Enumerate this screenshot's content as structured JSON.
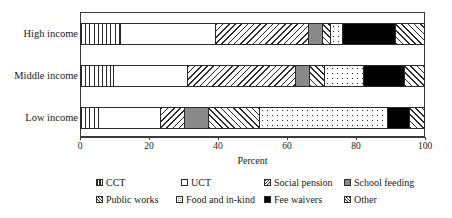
{
  "chart_data": {
    "type": "bar",
    "orientation": "horizontal",
    "stacked": true,
    "normalized_percent": true,
    "title": "",
    "xlabel": "Percent",
    "ylabel": "",
    "xlim": [
      0,
      100
    ],
    "xticks": [
      0,
      20,
      40,
      60,
      80,
      100
    ],
    "xtick_labels": [
      "0",
      "20",
      "40",
      "60",
      "80",
      "100"
    ],
    "grid": false,
    "legend_position": "bottom",
    "categories": [
      "High income",
      "Middle income",
      "Low income"
    ],
    "series": [
      {
        "name": "CCT",
        "pattern": "vertical-lines",
        "values": [
          12.0,
          9.8,
          5.5
        ]
      },
      {
        "name": "UCT",
        "pattern": "solid-white",
        "values": [
          27.4,
          21.5,
          18.0
        ]
      },
      {
        "name": "Social pension",
        "pattern": "back-diagonal",
        "values": [
          27.0,
          31.3,
          6.9
        ]
      },
      {
        "name": "School feeding",
        "pattern": "solid-gray",
        "values": [
          4.0,
          4.1,
          7.0
        ]
      },
      {
        "name": "Public works",
        "pattern": "forward-diagonal",
        "values": [
          2.3,
          4.3,
          14.8
        ]
      },
      {
        "name": "Food and in-kind",
        "pattern": "dots",
        "values": [
          3.5,
          11.3,
          37.0
        ]
      },
      {
        "name": "Fee waivers",
        "pattern": "solid-black",
        "values": [
          15.4,
          11.9,
          6.5
        ]
      },
      {
        "name": "Other",
        "pattern": "forward-diagonal",
        "values": [
          8.4,
          5.8,
          4.3
        ]
      }
    ],
    "cumulative_boundaries": {
      "High income": [
        12.0,
        39.4,
        66.4,
        70.4,
        72.7,
        76.2,
        91.6,
        100.0
      ],
      "Middle income": [
        9.8,
        31.3,
        62.6,
        66.7,
        71.0,
        82.3,
        94.2,
        100.0
      ],
      "Low income": [
        5.5,
        23.5,
        30.4,
        37.4,
        52.2,
        89.2,
        95.7,
        100.0
      ]
    },
    "colors": {
      "outline": "#2a2a2a",
      "school_feeding_gray": "#8a8a8a",
      "fee_waivers_black": "#000000",
      "background": "#ffffff"
    }
  },
  "legend": {
    "row1": [
      "CCT",
      "UCT",
      "Social pension",
      "School feeding"
    ],
    "row2": [
      "Public works",
      "Food and in-kind",
      "Fee waivers",
      "Other"
    ]
  }
}
